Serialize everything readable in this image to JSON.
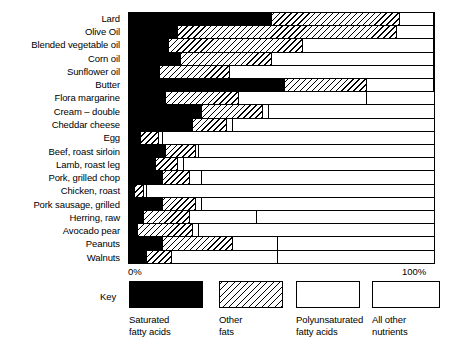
{
  "chart_data": {
    "type": "bar",
    "subtype": "stacked-horizontal-100-percent",
    "title": "",
    "xlabel": "",
    "ylabel": "",
    "xlim": [
      0,
      100
    ],
    "xticks": [
      "0%",
      "100%"
    ],
    "grid": false,
    "legend_position": "bottom",
    "legend_title": "Key",
    "series": [
      {
        "name": "Saturated fatty acids",
        "pattern": "solid-black",
        "values": [
          47,
          16,
          13,
          17,
          10,
          51,
          12,
          24,
          21,
          4,
          12,
          9,
          11,
          2,
          11,
          5,
          3,
          11,
          6
        ]
      },
      {
        "name": "Other fats",
        "pattern": "diagonal-hatch",
        "values": [
          42,
          72,
          44,
          30,
          23,
          27,
          24,
          20,
          11,
          6,
          10,
          7,
          9,
          3,
          11,
          15,
          18,
          23,
          8
        ]
      },
      {
        "name": "Polyunsaturated fatty acids",
        "pattern": "white-outlined",
        "values": [
          11,
          12,
          43,
          53,
          67,
          22,
          42,
          2,
          2,
          1,
          1,
          2,
          4,
          1,
          2,
          22,
          2,
          15,
          35
        ]
      },
      {
        "name": "All other nutrients",
        "pattern": "white",
        "values": [
          0,
          0,
          0,
          0,
          0,
          0,
          22,
          54,
          66,
          89,
          77,
          82,
          76,
          94,
          76,
          58,
          77,
          51,
          51
        ]
      }
    ],
    "categories": [
      "Lard",
      "Olive Oil",
      "Blended vegetable oil",
      "Corn oil",
      "Sunflower oil",
      "Butter",
      "Flora margarine",
      "Cream – double",
      "Cheddar cheese",
      "Egg",
      "Beef, roast sirloin",
      "Lamb, roast leg",
      "Pork, grilled chop",
      "Chicken, roast",
      "Pork sausage, grilled",
      "Herring, raw",
      "Avocado pear",
      "Peanuts",
      "Walnuts"
    ]
  },
  "axis": {
    "left_tick": "0%",
    "right_tick": "100%"
  },
  "key": {
    "word": "Key",
    "items": [
      {
        "label": "Saturated\nfatty acids",
        "swatch": "solid-black"
      },
      {
        "label": "Other\nfats",
        "swatch": "diagonal-hatch"
      },
      {
        "label": "Polyunsaturated\nfatty acids",
        "swatch": "white-outlined"
      },
      {
        "label": "All other\nnutrients",
        "swatch": "white-outlined"
      }
    ]
  },
  "colors": {
    "saturated": "#000000",
    "other_fats_lines": "#000000",
    "background": "#ffffff",
    "axis": "#000000"
  }
}
